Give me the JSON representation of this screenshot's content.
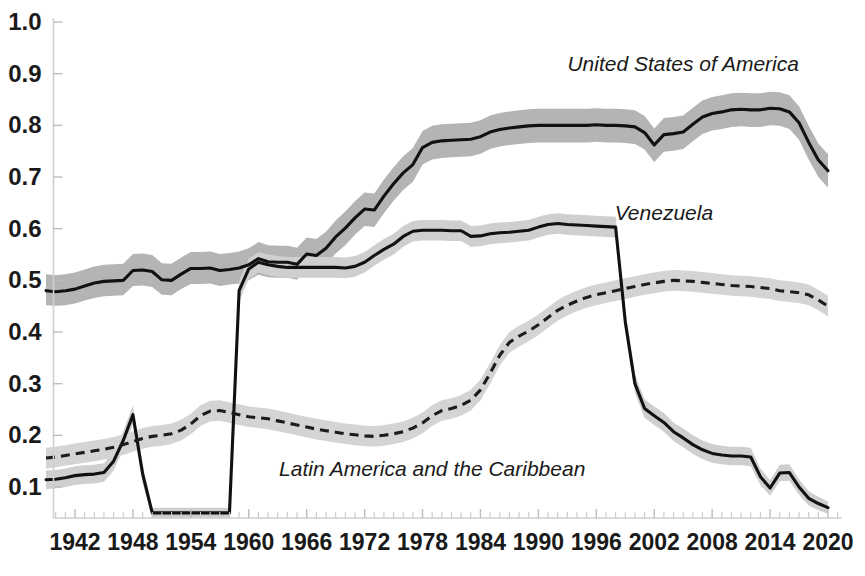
{
  "chart_data": {
    "type": "line",
    "title": "",
    "subtitle": "",
    "xlabel": "",
    "ylabel": "",
    "xlim": [
      1939,
      2021
    ],
    "ylim": [
      0.04,
      1.0
    ],
    "grid": false,
    "legend_position": "inline-annotations",
    "y_ticks": [
      "1.0",
      "0.9",
      "0.8",
      "0.7",
      "0.6",
      "0.5",
      "0.4",
      "0.3",
      "0.2",
      "0.1"
    ],
    "y_tick_values": [
      1.0,
      0.9,
      0.8,
      0.7,
      0.6,
      0.5,
      0.4,
      0.3,
      0.2,
      0.1
    ],
    "x_ticks": [
      "1942",
      "1948",
      "1954",
      "1960",
      "1966",
      "1972",
      "1978",
      "1984",
      "1990",
      "1996",
      "2002",
      "2008",
      "2014",
      "2020"
    ],
    "x_tick_values": [
      1942,
      1948,
      1954,
      1960,
      1966,
      1972,
      1978,
      1984,
      1990,
      1996,
      2002,
      2008,
      2014,
      2020
    ],
    "x_minor_tick_step": 1,
    "annotations": [
      {
        "text": "United States of America",
        "x": 2005,
        "y": 0.905,
        "style": "italic"
      },
      {
        "text": "Venezuela",
        "x": 2003,
        "y": 0.617,
        "style": "italic"
      },
      {
        "text": "Latin America and the Caribbean",
        "x": 1979,
        "y": 0.122,
        "style": "italic"
      }
    ],
    "x": [
      1939,
      1940,
      1941,
      1942,
      1943,
      1944,
      1945,
      1946,
      1947,
      1948,
      1949,
      1950,
      1951,
      1952,
      1953,
      1954,
      1955,
      1956,
      1957,
      1958,
      1959,
      1960,
      1961,
      1962,
      1963,
      1964,
      1965,
      1966,
      1967,
      1968,
      1969,
      1970,
      1971,
      1972,
      1973,
      1974,
      1975,
      1976,
      1977,
      1978,
      1979,
      1980,
      1981,
      1982,
      1983,
      1984,
      1985,
      1986,
      1987,
      1988,
      1989,
      1990,
      1991,
      1992,
      1993,
      1994,
      1995,
      1996,
      1997,
      1998,
      1999,
      2000,
      2001,
      2002,
      2003,
      2004,
      2005,
      2006,
      2007,
      2008,
      2009,
      2010,
      2011,
      2012,
      2013,
      2014,
      2015,
      2016,
      2017,
      2018,
      2019,
      2020
    ],
    "series": [
      {
        "name": "United States of America",
        "style": "solid",
        "color": "#111111",
        "band_color": "#b4b4b4",
        "values": [
          0.48,
          0.478,
          0.48,
          0.483,
          0.489,
          0.495,
          0.498,
          0.499,
          0.5,
          0.519,
          0.52,
          0.517,
          0.501,
          0.5,
          0.512,
          0.523,
          0.523,
          0.524,
          0.519,
          0.521,
          0.524,
          0.53,
          0.542,
          0.536,
          0.535,
          0.535,
          0.531,
          0.551,
          0.548,
          0.562,
          0.584,
          0.601,
          0.621,
          0.638,
          0.636,
          0.663,
          0.687,
          0.708,
          0.724,
          0.757,
          0.767,
          0.77,
          0.771,
          0.772,
          0.773,
          0.778,
          0.787,
          0.792,
          0.795,
          0.797,
          0.799,
          0.8,
          0.8,
          0.8,
          0.8,
          0.8,
          0.8,
          0.801,
          0.8,
          0.8,
          0.799,
          0.797,
          0.786,
          0.762,
          0.782,
          0.784,
          0.787,
          0.802,
          0.816,
          0.823,
          0.826,
          0.83,
          0.831,
          0.83,
          0.83,
          0.833,
          0.832,
          0.826,
          0.805,
          0.767,
          0.733,
          0.712
        ],
        "band_lower": [
          0.452,
          0.451,
          0.452,
          0.455,
          0.461,
          0.466,
          0.469,
          0.47,
          0.471,
          0.489,
          0.49,
          0.487,
          0.472,
          0.471,
          0.483,
          0.493,
          0.493,
          0.494,
          0.489,
          0.492,
          0.494,
          0.5,
          0.511,
          0.506,
          0.505,
          0.505,
          0.501,
          0.521,
          0.518,
          0.531,
          0.552,
          0.568,
          0.588,
          0.605,
          0.603,
          0.63,
          0.654,
          0.675,
          0.691,
          0.724,
          0.734,
          0.737,
          0.738,
          0.739,
          0.74,
          0.745,
          0.754,
          0.759,
          0.762,
          0.764,
          0.766,
          0.767,
          0.767,
          0.767,
          0.767,
          0.767,
          0.767,
          0.768,
          0.767,
          0.767,
          0.766,
          0.764,
          0.753,
          0.729,
          0.749,
          0.751,
          0.754,
          0.769,
          0.783,
          0.79,
          0.793,
          0.797,
          0.798,
          0.797,
          0.797,
          0.8,
          0.799,
          0.793,
          0.772,
          0.734,
          0.7,
          0.679
        ],
        "band_upper": [
          0.512,
          0.51,
          0.512,
          0.515,
          0.521,
          0.527,
          0.53,
          0.531,
          0.532,
          0.551,
          0.552,
          0.549,
          0.533,
          0.532,
          0.544,
          0.555,
          0.555,
          0.556,
          0.551,
          0.553,
          0.556,
          0.562,
          0.574,
          0.568,
          0.567,
          0.567,
          0.563,
          0.583,
          0.58,
          0.594,
          0.616,
          0.633,
          0.653,
          0.67,
          0.668,
          0.695,
          0.719,
          0.74,
          0.756,
          0.789,
          0.799,
          0.802,
          0.803,
          0.804,
          0.805,
          0.81,
          0.819,
          0.824,
          0.827,
          0.829,
          0.831,
          0.832,
          0.832,
          0.832,
          0.832,
          0.832,
          0.832,
          0.833,
          0.832,
          0.832,
          0.831,
          0.829,
          0.818,
          0.794,
          0.814,
          0.816,
          0.819,
          0.834,
          0.848,
          0.855,
          0.858,
          0.862,
          0.863,
          0.862,
          0.862,
          0.865,
          0.864,
          0.858,
          0.837,
          0.799,
          0.765,
          0.744
        ]
      },
      {
        "name": "Venezuela",
        "style": "solid",
        "color": "#111111",
        "band_color": "#cfcfcf",
        "values": [
          0.114,
          0.115,
          0.118,
          0.122,
          0.124,
          0.125,
          0.128,
          0.15,
          0.19,
          0.24,
          0.126,
          0.05,
          0.05,
          0.05,
          0.05,
          0.05,
          0.05,
          0.05,
          0.05,
          0.05,
          0.48,
          0.522,
          0.535,
          0.53,
          0.527,
          0.525,
          0.525,
          0.525,
          0.525,
          0.525,
          0.525,
          0.524,
          0.527,
          0.535,
          0.548,
          0.56,
          0.57,
          0.585,
          0.595,
          0.597,
          0.597,
          0.597,
          0.596,
          0.596,
          0.585,
          0.586,
          0.59,
          0.592,
          0.593,
          0.595,
          0.597,
          0.603,
          0.608,
          0.61,
          0.608,
          0.607,
          0.606,
          0.605,
          0.604,
          0.603,
          0.42,
          0.3,
          0.252,
          0.238,
          0.225,
          0.207,
          0.195,
          0.182,
          0.172,
          0.165,
          0.162,
          0.16,
          0.16,
          0.158,
          0.12,
          0.098,
          0.127,
          0.128,
          0.1,
          0.078,
          0.068,
          0.06
        ],
        "band_lower": [
          0.096,
          0.097,
          0.1,
          0.104,
          0.106,
          0.107,
          0.11,
          0.132,
          0.172,
          0.222,
          0.108,
          0.04,
          0.04,
          0.04,
          0.04,
          0.04,
          0.04,
          0.04,
          0.04,
          0.04,
          0.46,
          0.502,
          0.515,
          0.51,
          0.507,
          0.505,
          0.505,
          0.505,
          0.505,
          0.505,
          0.505,
          0.504,
          0.507,
          0.515,
          0.528,
          0.54,
          0.55,
          0.565,
          0.575,
          0.577,
          0.577,
          0.577,
          0.576,
          0.576,
          0.565,
          0.566,
          0.57,
          0.572,
          0.573,
          0.575,
          0.577,
          0.583,
          0.588,
          0.59,
          0.588,
          0.587,
          0.586,
          0.585,
          0.584,
          0.583,
          0.4,
          0.282,
          0.234,
          0.22,
          0.207,
          0.189,
          0.177,
          0.164,
          0.154,
          0.147,
          0.144,
          0.142,
          0.142,
          0.14,
          0.104,
          0.083,
          0.111,
          0.112,
          0.085,
          0.064,
          0.055,
          0.048
        ],
        "band_upper": [
          0.132,
          0.133,
          0.136,
          0.14,
          0.142,
          0.143,
          0.146,
          0.168,
          0.208,
          0.258,
          0.144,
          0.06,
          0.06,
          0.06,
          0.06,
          0.06,
          0.06,
          0.06,
          0.06,
          0.06,
          0.5,
          0.542,
          0.555,
          0.55,
          0.547,
          0.545,
          0.545,
          0.545,
          0.545,
          0.545,
          0.545,
          0.544,
          0.547,
          0.555,
          0.568,
          0.58,
          0.59,
          0.605,
          0.615,
          0.617,
          0.617,
          0.617,
          0.616,
          0.616,
          0.605,
          0.606,
          0.61,
          0.612,
          0.613,
          0.615,
          0.617,
          0.623,
          0.628,
          0.63,
          0.628,
          0.627,
          0.626,
          0.625,
          0.624,
          0.623,
          0.44,
          0.318,
          0.27,
          0.256,
          0.243,
          0.225,
          0.213,
          0.2,
          0.19,
          0.183,
          0.18,
          0.178,
          0.178,
          0.176,
          0.136,
          0.113,
          0.143,
          0.144,
          0.115,
          0.092,
          0.081,
          0.072
        ]
      },
      {
        "name": "Latin America and the Caribbean",
        "style": "dashed",
        "color": "#1c1c1c",
        "band_color": "#d4d4d4",
        "values": [
          0.156,
          0.158,
          0.161,
          0.164,
          0.167,
          0.17,
          0.173,
          0.177,
          0.182,
          0.188,
          0.194,
          0.198,
          0.2,
          0.203,
          0.21,
          0.222,
          0.238,
          0.247,
          0.248,
          0.244,
          0.24,
          0.236,
          0.234,
          0.232,
          0.228,
          0.224,
          0.22,
          0.216,
          0.212,
          0.209,
          0.206,
          0.203,
          0.201,
          0.199,
          0.198,
          0.2,
          0.203,
          0.207,
          0.214,
          0.224,
          0.238,
          0.248,
          0.252,
          0.258,
          0.268,
          0.288,
          0.32,
          0.355,
          0.38,
          0.392,
          0.402,
          0.414,
          0.428,
          0.442,
          0.452,
          0.46,
          0.467,
          0.472,
          0.476,
          0.48,
          0.484,
          0.488,
          0.492,
          0.495,
          0.498,
          0.5,
          0.499,
          0.498,
          0.496,
          0.494,
          0.492,
          0.49,
          0.489,
          0.488,
          0.486,
          0.484,
          0.48,
          0.478,
          0.476,
          0.472,
          0.462,
          0.45
        ],
        "band_lower": [
          0.136,
          0.138,
          0.141,
          0.144,
          0.147,
          0.15,
          0.153,
          0.157,
          0.162,
          0.168,
          0.174,
          0.178,
          0.18,
          0.183,
          0.19,
          0.202,
          0.218,
          0.227,
          0.228,
          0.224,
          0.22,
          0.216,
          0.214,
          0.212,
          0.208,
          0.204,
          0.2,
          0.196,
          0.192,
          0.189,
          0.186,
          0.183,
          0.181,
          0.179,
          0.178,
          0.18,
          0.183,
          0.187,
          0.194,
          0.204,
          0.218,
          0.228,
          0.232,
          0.238,
          0.248,
          0.268,
          0.3,
          0.335,
          0.36,
          0.372,
          0.382,
          0.394,
          0.408,
          0.422,
          0.432,
          0.44,
          0.447,
          0.452,
          0.456,
          0.46,
          0.464,
          0.468,
          0.472,
          0.475,
          0.478,
          0.48,
          0.479,
          0.478,
          0.476,
          0.474,
          0.472,
          0.47,
          0.469,
          0.468,
          0.466,
          0.464,
          0.46,
          0.458,
          0.456,
          0.452,
          0.442,
          0.43
        ],
        "band_upper": [
          0.176,
          0.178,
          0.181,
          0.184,
          0.187,
          0.19,
          0.193,
          0.197,
          0.202,
          0.208,
          0.214,
          0.218,
          0.22,
          0.223,
          0.23,
          0.242,
          0.258,
          0.267,
          0.268,
          0.264,
          0.26,
          0.256,
          0.254,
          0.252,
          0.248,
          0.244,
          0.24,
          0.236,
          0.232,
          0.229,
          0.226,
          0.223,
          0.221,
          0.219,
          0.218,
          0.22,
          0.223,
          0.227,
          0.234,
          0.244,
          0.258,
          0.268,
          0.272,
          0.278,
          0.288,
          0.308,
          0.34,
          0.375,
          0.4,
          0.412,
          0.422,
          0.434,
          0.448,
          0.462,
          0.472,
          0.48,
          0.487,
          0.492,
          0.496,
          0.5,
          0.504,
          0.508,
          0.512,
          0.515,
          0.518,
          0.52,
          0.519,
          0.518,
          0.516,
          0.514,
          0.512,
          0.51,
          0.509,
          0.508,
          0.506,
          0.504,
          0.5,
          0.498,
          0.496,
          0.492,
          0.482,
          0.47
        ]
      }
    ]
  }
}
